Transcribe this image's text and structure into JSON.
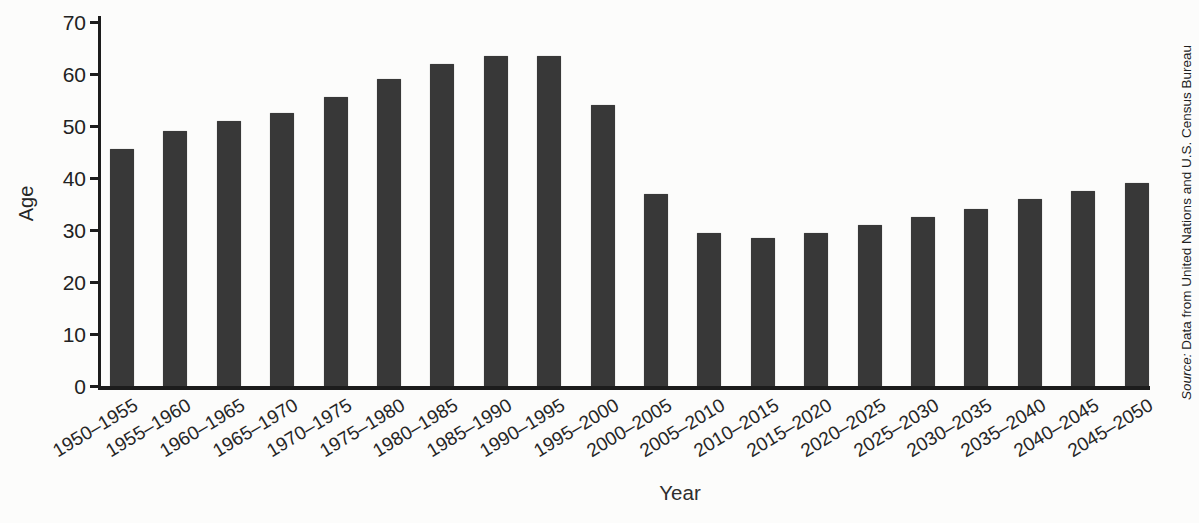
{
  "chart": {
    "ylabel": "Age",
    "xlabel": "Year",
    "source": {
      "prefix": "Source:",
      "rest": " Data from United Nations and U.S. Census Bureau"
    }
  },
  "chart_data": {
    "type": "bar",
    "title": "",
    "xlabel": "Year",
    "ylabel": "Age",
    "ylim": [
      0,
      70
    ],
    "yticks": [
      0,
      10,
      20,
      30,
      40,
      50,
      60,
      70
    ],
    "grid": false,
    "legend": "none",
    "bar_color": "#383838",
    "categories": [
      "1950–1955",
      "1955–1960",
      "1960–1965",
      "1965–1970",
      "1970–1975",
      "1975–1980",
      "1980–1985",
      "1985–1990",
      "1990–1995",
      "1995–2000",
      "2000–2005",
      "2005–2010",
      "2010–2015",
      "2015–2020",
      "2020–2025",
      "2025–2030",
      "2030–2035",
      "2035–2040",
      "2040–2045",
      "2045–2050"
    ],
    "values": [
      45.5,
      49,
      51,
      52.5,
      55.5,
      59,
      62,
      63.5,
      63.5,
      54,
      37,
      29.5,
      28.5,
      29.5,
      31,
      32.5,
      34,
      36,
      37.5,
      39
    ],
    "source": "Source: Data from United Nations and U.S. Census Bureau"
  },
  "colors": {
    "bar": "#383838",
    "axis": "#1c1c1c",
    "text": "#2a2a2a",
    "background": "#fcfcfb"
  }
}
